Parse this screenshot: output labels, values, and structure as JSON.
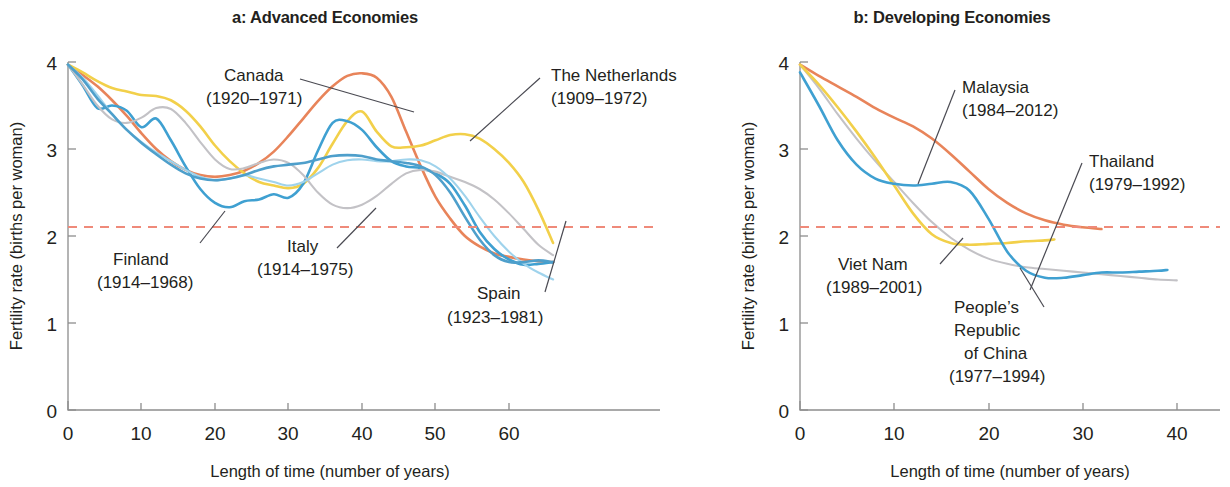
{
  "figure": {
    "panels": [
      {
        "id": "a",
        "title": "a: Advanced Economies",
        "x_axis_title": "Length of time (number of years)",
        "y_axis_title": "Fertility rate (births per woman)",
        "x_ticks": [
          "0",
          "10",
          "20",
          "30",
          "40",
          "50",
          "60"
        ],
        "y_ticks": [
          "4",
          "3",
          "2",
          "1",
          "0"
        ],
        "annotations": [
          {
            "name": "canada",
            "line1": "Canada",
            "line2": "(1920–1971)"
          },
          {
            "name": "netherlands",
            "line1": "The Netherlands",
            "line2": "(1909–1972)"
          },
          {
            "name": "finland",
            "line1": "Finland",
            "line2": "(1914–1968)"
          },
          {
            "name": "italy",
            "line1": "Italy",
            "line2": "(1914–1975)"
          },
          {
            "name": "spain",
            "line1": "Spain",
            "line2": "(1923–1981)"
          }
        ]
      },
      {
        "id": "b",
        "title": "b: Developing Economies",
        "x_axis_title": "Length of time (number of years)",
        "y_axis_title": "Fertility rate (births per woman)",
        "x_ticks": [
          "0",
          "10",
          "20",
          "30",
          "40"
        ],
        "y_ticks": [
          "4",
          "3",
          "2",
          "1",
          "0"
        ],
        "annotations": [
          {
            "name": "malaysia",
            "line1": "Malaysia",
            "line2": "(1984–2012)"
          },
          {
            "name": "thailand",
            "line1": "Thailand",
            "line2": "(1979–1992)"
          },
          {
            "name": "viet-nam",
            "line1": "Viet Nam",
            "line2": "(1989–2001)"
          },
          {
            "name": "china",
            "line1": "People’s",
            "line2": "Republic",
            "line3": "of China",
            "line4": "(1977–1994)"
          }
        ]
      }
    ]
  },
  "colors": {
    "orange": "#E8845A",
    "yellow": "#F2D04A",
    "blue": "#3FA0D1",
    "light_blue": "#9FD3EC",
    "gray": "#C3C2C6",
    "steel_blue": "#4E9FCB",
    "reference": "#EF8A7A",
    "axis": "#8D8D8D",
    "text": "#231F20"
  },
  "chart_data": {
    "type": "line",
    "xlabel": "Length of time (number of years)",
    "ylabel": "Fertility rate (births per woman)",
    "xlim_a": [
      0,
      66
    ],
    "xlim_b": [
      0,
      44
    ],
    "ylim": [
      0,
      4
    ],
    "grid": false,
    "legend": "inline annotations with leader lines",
    "reference_line": {
      "value": 2.1,
      "label": "replacement level",
      "style": "dashed",
      "color": "#EF8A7A"
    },
    "panels": [
      {
        "id": "a",
        "title": "a: Advanced Economies",
        "series": [
          {
            "name": "Canada (1920–1971)",
            "color": "#E8845A",
            "x": [
              0,
              2,
              4,
              6,
              8,
              10,
              12,
              14,
              16,
              18,
              20,
              22,
              24,
              26,
              28,
              30,
              32,
              34,
              36,
              38,
              40,
              42,
              44,
              46,
              48,
              50,
              52,
              54,
              56,
              58,
              60,
              62,
              64,
              66
            ],
            "y": [
              3.97,
              3.85,
              3.72,
              3.56,
              3.38,
              3.18,
              3.0,
              2.86,
              2.76,
              2.7,
              2.68,
              2.7,
              2.75,
              2.84,
              2.97,
              3.15,
              3.35,
              3.55,
              3.72,
              3.84,
              3.87,
              3.82,
              3.6,
              3.2,
              2.8,
              2.45,
              2.2,
              2.0,
              1.88,
              1.8,
              1.76,
              1.73,
              1.71,
              1.7
            ]
          },
          {
            "name": "The Netherlands (1909–1972)",
            "color": "#F2D04A",
            "x": [
              0,
              2,
              4,
              6,
              8,
              10,
              12,
              14,
              16,
              18,
              20,
              22,
              24,
              26,
              28,
              30,
              32,
              34,
              36,
              38,
              40,
              42,
              44,
              46,
              48,
              50,
              52,
              54,
              56,
              58,
              60,
              62,
              64,
              66
            ],
            "y": [
              3.97,
              3.88,
              3.78,
              3.7,
              3.66,
              3.62,
              3.61,
              3.56,
              3.44,
              3.26,
              3.04,
              2.86,
              2.72,
              2.62,
              2.58,
              2.55,
              2.6,
              2.78,
              3.06,
              3.32,
              3.43,
              3.2,
              3.03,
              3.02,
              3.04,
              3.1,
              3.16,
              3.17,
              3.12,
              3.0,
              2.84,
              2.62,
              2.3,
              1.92
            ]
          },
          {
            "name": "Finland (1914–1968)",
            "color": "#3FA0D1",
            "x": [
              0,
              2,
              4,
              6,
              8,
              10,
              12,
              14,
              16,
              18,
              20,
              22,
              24,
              26,
              28,
              30,
              32,
              34,
              36,
              38,
              40,
              42,
              44,
              46,
              48,
              50,
              52,
              54,
              56,
              58,
              60,
              62,
              64,
              66
            ],
            "y": [
              3.97,
              3.73,
              3.47,
              3.5,
              3.44,
              3.25,
              3.35,
              3.1,
              2.8,
              2.54,
              2.38,
              2.33,
              2.4,
              2.42,
              2.48,
              2.44,
              2.6,
              2.98,
              3.3,
              3.32,
              3.22,
              3.02,
              2.86,
              2.8,
              2.78,
              2.72,
              2.6,
              2.35,
              2.05,
              1.85,
              1.73,
              1.67,
              1.68,
              1.7
            ]
          },
          {
            "name": "Italy (1914–1975)",
            "color": "#C3C2C6",
            "x": [
              0,
              2,
              4,
              6,
              8,
              10,
              12,
              14,
              16,
              18,
              20,
              22,
              24,
              26,
              28,
              30,
              32,
              34,
              36,
              38,
              40,
              42,
              44,
              46,
              48,
              50,
              52,
              54,
              56,
              58,
              60,
              62,
              64,
              66
            ],
            "y": [
              3.97,
              3.74,
              3.5,
              3.34,
              3.3,
              3.36,
              3.47,
              3.46,
              3.3,
              3.08,
              2.88,
              2.77,
              2.78,
              2.84,
              2.88,
              2.84,
              2.7,
              2.5,
              2.36,
              2.32,
              2.36,
              2.46,
              2.6,
              2.72,
              2.76,
              2.74,
              2.68,
              2.62,
              2.54,
              2.42,
              2.26,
              2.08,
              1.9,
              1.78
            ]
          },
          {
            "name": "Spain (1923–1981)",
            "color": "#9FD3EC",
            "x": [
              0,
              2,
              4,
              6,
              8,
              10,
              12,
              14,
              16,
              18,
              20,
              22,
              24,
              26,
              28,
              30,
              32,
              34,
              36,
              38,
              40,
              42,
              44,
              46,
              48,
              50,
              52,
              54,
              56,
              58,
              60,
              62,
              64,
              66
            ],
            "y": [
              3.97,
              3.82,
              3.62,
              3.4,
              3.22,
              3.08,
              2.96,
              2.86,
              2.76,
              2.68,
              2.64,
              2.66,
              2.7,
              2.66,
              2.62,
              2.58,
              2.62,
              2.72,
              2.82,
              2.87,
              2.88,
              2.86,
              2.86,
              2.88,
              2.87,
              2.8,
              2.66,
              2.46,
              2.22,
              2.0,
              1.82,
              1.68,
              1.58,
              1.5
            ]
          },
          {
            "name": "Sixth advanced economy series",
            "color": "#4E9FCB",
            "x": [
              0,
              2,
              4,
              6,
              8,
              10,
              12,
              14,
              16,
              18,
              20,
              22,
              24,
              26,
              28,
              30,
              32,
              34,
              36,
              38,
              40,
              42,
              44,
              46,
              48,
              50,
              52,
              54,
              56,
              58,
              60,
              62,
              64,
              66
            ],
            "y": [
              3.97,
              3.8,
              3.58,
              3.4,
              3.22,
              3.07,
              2.94,
              2.82,
              2.72,
              2.66,
              2.64,
              2.66,
              2.7,
              2.76,
              2.8,
              2.82,
              2.84,
              2.88,
              2.92,
              2.93,
              2.92,
              2.88,
              2.86,
              2.84,
              2.8,
              2.7,
              2.5,
              2.22,
              1.96,
              1.78,
              1.7,
              1.7,
              1.72,
              1.7
            ]
          }
        ]
      },
      {
        "id": "b",
        "title": "b: Developing Economies",
        "series": [
          {
            "name": "Malaysia (1984–2012)",
            "color": "#E8845A",
            "x": [
              0,
              2,
              4,
              6,
              8,
              10,
              12,
              14,
              16,
              18,
              20,
              22,
              24,
              26,
              28,
              30,
              32
            ],
            "y": [
              3.97,
              3.84,
              3.72,
              3.6,
              3.47,
              3.36,
              3.26,
              3.12,
              2.94,
              2.74,
              2.54,
              2.38,
              2.26,
              2.18,
              2.13,
              2.1,
              2.08
            ]
          },
          {
            "name": "Thailand (1979–1992)",
            "color": "#C3C2C6",
            "x": [
              0,
              2,
              4,
              6,
              8,
              10,
              12,
              14,
              16,
              18,
              20,
              22,
              24,
              26,
              28,
              30,
              32,
              34,
              36,
              38,
              40
            ],
            "y": [
              3.97,
              3.7,
              3.4,
              3.12,
              2.86,
              2.62,
              2.38,
              2.16,
              1.98,
              1.84,
              1.74,
              1.68,
              1.64,
              1.62,
              1.6,
              1.58,
              1.56,
              1.54,
              1.52,
              1.5,
              1.49
            ]
          },
          {
            "name": "Viet Nam (1989–2001)",
            "color": "#F2D04A",
            "x": [
              0,
              2,
              4,
              6,
              8,
              10,
              12,
              14,
              16,
              18,
              20,
              22,
              24,
              26,
              27
            ],
            "y": [
              3.97,
              3.74,
              3.48,
              3.2,
              2.9,
              2.58,
              2.26,
              2.02,
              1.92,
              1.9,
              1.91,
              1.92,
              1.94,
              1.95,
              1.96
            ]
          },
          {
            "name": "People’s Republic of China (1977–1994)",
            "color": "#3FA0D1",
            "x": [
              0,
              2,
              4,
              6,
              8,
              10,
              12,
              14,
              16,
              18,
              20,
              22,
              24,
              26,
              28,
              30,
              32,
              34,
              36,
              38,
              39
            ],
            "y": [
              3.88,
              3.5,
              3.1,
              2.82,
              2.66,
              2.6,
              2.58,
              2.6,
              2.62,
              2.52,
              2.2,
              1.82,
              1.6,
              1.52,
              1.52,
              1.55,
              1.58,
              1.58,
              1.59,
              1.6,
              1.61
            ]
          }
        ]
      }
    ]
  }
}
